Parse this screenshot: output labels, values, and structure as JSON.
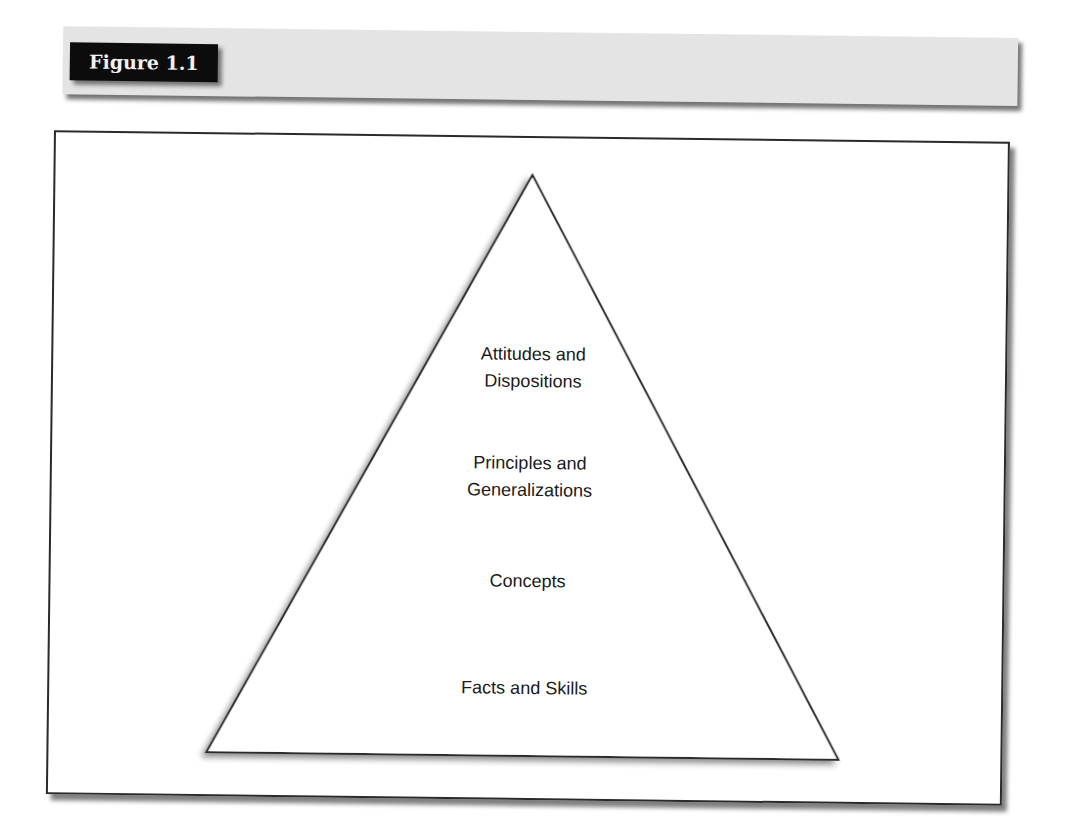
{
  "figure": {
    "label": "Figure 1.1"
  },
  "pyramid": {
    "levels": [
      {
        "line1": "Attitudes and",
        "line2": "Dispositions"
      },
      {
        "line1": "Principles and",
        "line2": "Generalizations"
      },
      {
        "line1": "Concepts",
        "line2": ""
      },
      {
        "line1": "Facts and Skills",
        "line2": ""
      }
    ]
  },
  "colors": {
    "header_band": "#e4e4e4",
    "label_bg": "#0c0c0c",
    "label_text": "#f2f2f2",
    "stroke": "#2a2a2a"
  }
}
